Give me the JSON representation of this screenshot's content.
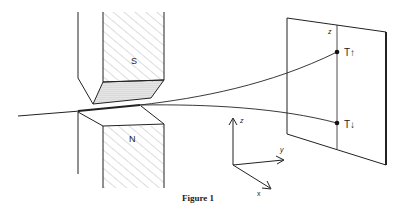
{
  "figure": {
    "caption": "Figure 1",
    "magnets": {
      "top_pole": "S",
      "bottom_pole": "N"
    },
    "screen": {
      "axis_label": "z",
      "spots": [
        {
          "label": "T↑",
          "position": "upper"
        },
        {
          "label": "T↓",
          "position": "lower"
        }
      ]
    },
    "axes": {
      "z": "z",
      "y": "y",
      "x": "x"
    },
    "colors": {
      "line": "#222222",
      "background": "#ffffff"
    }
  }
}
